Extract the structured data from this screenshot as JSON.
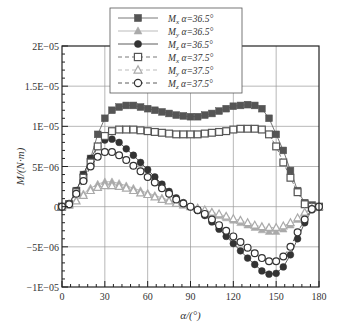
{
  "chart_data": {
    "type": "line",
    "title": "",
    "xlabel": "α/(°)",
    "ylabel": "M/(N·m)",
    "xlim": [
      0,
      180
    ],
    "ylim": [
      -1e-05,
      2e-05
    ],
    "x_ticks": [
      "0",
      "30",
      "60",
      "90",
      "120",
      "150",
      "180"
    ],
    "y_ticks": [
      "-1E-05",
      "-5E-06",
      "0",
      "5E-06",
      "1E-05",
      "1.5E-05",
      "2E-05"
    ],
    "grid": true,
    "legend_position": "top-center",
    "x": [
      0,
      5,
      10,
      15,
      20,
      25,
      30,
      35,
      40,
      45,
      50,
      55,
      60,
      65,
      70,
      75,
      80,
      85,
      90,
      95,
      100,
      105,
      110,
      115,
      120,
      125,
      130,
      135,
      140,
      145,
      150,
      155,
      160,
      165,
      170,
      175,
      180
    ],
    "series": [
      {
        "name": "Mx α=36.5°",
        "label_main": "M",
        "label_sub": "x",
        "label_rest": " α=36.5°",
        "marker": "square-filled",
        "color": "#555555",
        "line": "solid",
        "values": [
          0,
          3e-07,
          2e-06,
          4e-06,
          6e-06,
          9e-06,
          1.1e-05,
          1.2e-05,
          1.24e-05,
          1.26e-05,
          1.26e-05,
          1.24e-05,
          1.22e-05,
          1.2e-05,
          1.18e-05,
          1.16e-05,
          1.14e-05,
          1.13e-05,
          1.12e-05,
          1.12e-05,
          1.14e-05,
          1.16e-05,
          1.19e-05,
          1.22e-05,
          1.25e-05,
          1.26e-05,
          1.27e-05,
          1.26e-05,
          1.22e-05,
          1.1e-05,
          9e-06,
          7e-06,
          4.5e-06,
          2e-06,
          5e-07,
          2e-07,
          0
        ]
      },
      {
        "name": "My α=36.5°",
        "label_main": "M",
        "label_sub": "y",
        "label_rest": " α=36.5°",
        "marker": "triangle-filled",
        "color": "#aaaaaa",
        "line": "solid",
        "values": [
          0,
          2e-07,
          8e-07,
          1.6e-06,
          2.3e-06,
          2.8e-06,
          3.1e-06,
          3.1e-06,
          2.9e-06,
          2.6e-06,
          2.3e-06,
          2e-06,
          1.7e-06,
          1.4e-06,
          1.1e-06,
          8e-07,
          5e-07,
          2e-07,
          0,
          -2e-07,
          -5e-07,
          -8e-07,
          -1.1e-06,
          -1.4e-06,
          -1.7e-06,
          -2e-06,
          -2.3e-06,
          -2.6e-06,
          -2.9e-06,
          -3.1e-06,
          -3.1e-06,
          -2.8e-06,
          -2.3e-06,
          -1.6e-06,
          -8e-07,
          -2e-07,
          0
        ]
      },
      {
        "name": "Mz α=36.5°",
        "label_main": "M",
        "label_sub": "z",
        "label_rest": " α=36.5°",
        "marker": "circle-filled",
        "color": "#333333",
        "line": "solid",
        "values": [
          0,
          4e-07,
          2e-06,
          4e-06,
          6e-06,
          7.5e-06,
          8.3e-06,
          8.4e-06,
          8e-06,
          7.2e-06,
          6.4e-06,
          5.5e-06,
          4.6e-06,
          3.7e-06,
          2.8e-06,
          1.9e-06,
          1.1e-06,
          5e-07,
          0,
          -5e-07,
          -1.1e-06,
          -1.9e-06,
          -2.8e-06,
          -3.7e-06,
          -4.6e-06,
          -5.5e-06,
          -6.4e-06,
          -7.2e-06,
          -8e-06,
          -8.4e-06,
          -8.3e-06,
          -7.5e-06,
          -6e-06,
          -4e-06,
          -2e-06,
          -4e-07,
          0
        ]
      },
      {
        "name": "Mx α=37.5°",
        "label_main": "M",
        "label_sub": "x",
        "label_rest": " α=37.5°",
        "marker": "square-open",
        "color": "#555555",
        "line": "dashed",
        "values": [
          0,
          3e-07,
          1.8e-06,
          3.6e-06,
          5.5e-06,
          7.5e-06,
          8.8e-06,
          9.4e-06,
          9.6e-06,
          9.6e-06,
          9.6e-06,
          9.5e-06,
          9.4e-06,
          9.3e-06,
          9.2e-06,
          9.1e-06,
          9e-06,
          9e-06,
          9e-06,
          9e-06,
          9.1e-06,
          9.2e-06,
          9.3e-06,
          9.4e-06,
          9.6e-06,
          9.7e-06,
          9.7e-06,
          9.7e-06,
          9.6e-06,
          9e-06,
          7.5e-06,
          5.5e-06,
          3.6e-06,
          1.8e-06,
          3e-07,
          0,
          0
        ]
      },
      {
        "name": "My α=37.5°",
        "label_main": "M",
        "label_sub": "y",
        "label_rest": " α=37.5°",
        "marker": "triangle-open",
        "color": "#aaaaaa",
        "line": "dashed",
        "values": [
          0,
          2e-07,
          7e-07,
          1.4e-06,
          2e-06,
          2.4e-06,
          2.6e-06,
          2.6e-06,
          2.5e-06,
          2.3e-06,
          2e-06,
          1.7e-06,
          1.5e-06,
          1.2e-06,
          9e-07,
          7e-07,
          4e-07,
          2e-07,
          0,
          -2e-07,
          -4e-07,
          -7e-07,
          -9e-07,
          -1.2e-06,
          -1.5e-06,
          -1.7e-06,
          -2e-06,
          -2.3e-06,
          -2.5e-06,
          -2.6e-06,
          -2.6e-06,
          -2.4e-06,
          -2e-06,
          -1.4e-06,
          -7e-07,
          -2e-07,
          0
        ]
      },
      {
        "name": "Mz α=37.5°",
        "label_main": "M",
        "label_sub": "z",
        "label_rest": " α=37.5°",
        "marker": "circle-open",
        "color": "#333333",
        "line": "dashed",
        "values": [
          0,
          3e-07,
          1.6e-06,
          3.2e-06,
          5e-06,
          6.2e-06,
          6.8e-06,
          6.8e-06,
          6.4e-06,
          5.8e-06,
          5.1e-06,
          4.4e-06,
          3.7e-06,
          3e-06,
          2.3e-06,
          1.6e-06,
          9e-07,
          4e-07,
          0,
          -4e-07,
          -9e-07,
          -1.6e-06,
          -2.3e-06,
          -3e-06,
          -3.7e-06,
          -4.4e-06,
          -5.1e-06,
          -5.8e-06,
          -6.4e-06,
          -6.8e-06,
          -6.8e-06,
          -6.2e-06,
          -5e-06,
          -3.2e-06,
          -1.6e-06,
          -3e-07,
          0
        ]
      }
    ]
  }
}
